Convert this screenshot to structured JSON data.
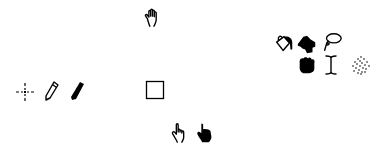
{
  "canvas": {
    "background": "#ffffff",
    "icon_color": "#000000"
  },
  "cursors": [
    {
      "id": "grab",
      "icon": "open-hand-icon"
    },
    {
      "id": "fill",
      "icon": "paint-bucket-icon"
    },
    {
      "id": "brush",
      "icon": "filled-hand-brush-icon"
    },
    {
      "id": "lasso",
      "icon": "lasso-icon"
    },
    {
      "id": "grabbing",
      "icon": "closed-fist-icon"
    },
    {
      "id": "text",
      "icon": "i-beam-icon"
    },
    {
      "id": "spray",
      "icon": "spray-dots-icon"
    },
    {
      "id": "crosshair",
      "icon": "crosshair-icon"
    },
    {
      "id": "pencil",
      "icon": "pencil-outline-icon"
    },
    {
      "id": "marker",
      "icon": "pencil-filled-icon"
    },
    {
      "id": "rectangle",
      "icon": "square-outline-icon"
    },
    {
      "id": "pointer",
      "icon": "pointing-hand-outline-icon"
    },
    {
      "id": "pointer-filled",
      "icon": "pointing-hand-filled-icon"
    }
  ]
}
